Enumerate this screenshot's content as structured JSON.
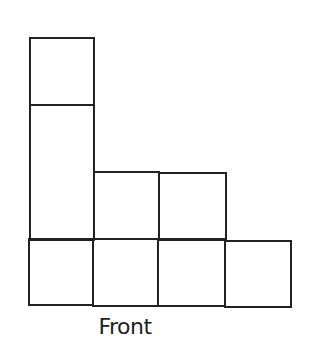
{
  "diagram": {
    "view_label": "Front",
    "stroke_color": "#222222",
    "background": "#ffffff",
    "columns": [
      {
        "index": 1,
        "height_units": 3,
        "cells": [
          "bottom",
          "middle (tall, spans 2 rows visually)",
          "top"
        ]
      },
      {
        "index": 2,
        "height_units": 2,
        "cells": [
          "bottom",
          "middle"
        ]
      },
      {
        "index": 3,
        "height_units": 2,
        "cells": [
          "bottom",
          "middle"
        ]
      },
      {
        "index": 4,
        "height_units": 1,
        "cells": [
          "bottom"
        ]
      }
    ]
  }
}
